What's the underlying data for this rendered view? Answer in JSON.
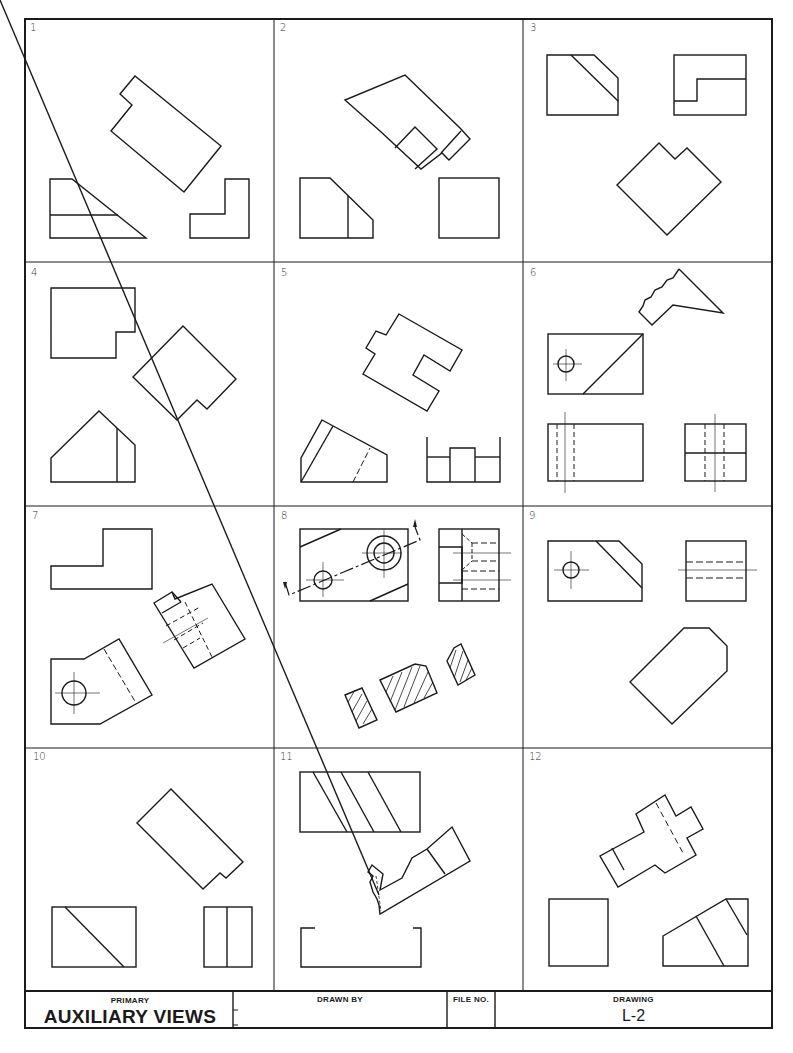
{
  "document": {
    "type": "drafting-worksheet",
    "border_color": "#1a1a1a",
    "line_color": "#1a1a1a"
  },
  "problems": [
    {
      "number": "1",
      "views": [
        "front-view",
        "side-view",
        "auxiliary-view-incomplete"
      ]
    },
    {
      "number": "2",
      "views": [
        "front-view",
        "side-view",
        "auxiliary-view-incomplete"
      ]
    },
    {
      "number": "3",
      "views": [
        "front-view",
        "side-view",
        "auxiliary-view-incomplete"
      ]
    },
    {
      "number": "4",
      "views": [
        "top-view",
        "front-view",
        "auxiliary-view-incomplete"
      ]
    },
    {
      "number": "5",
      "views": [
        "front-view",
        "side-view",
        "auxiliary-view-incomplete"
      ]
    },
    {
      "number": "6",
      "views": [
        "top-view",
        "front-view",
        "side-view",
        "partial-auxiliary-view"
      ]
    },
    {
      "number": "7",
      "views": [
        "top-view",
        "front-view",
        "auxiliary-view"
      ]
    },
    {
      "number": "8",
      "views": [
        "front-view",
        "side-view",
        "sectional-auxiliary-view"
      ]
    },
    {
      "number": "9",
      "views": [
        "front-view",
        "side-view",
        "auxiliary-view-incomplete"
      ]
    },
    {
      "number": "10",
      "views": [
        "front-view",
        "side-view",
        "auxiliary-view-incomplete"
      ]
    },
    {
      "number": "11",
      "views": [
        "top-view",
        "front-view-incomplete",
        "partial-auxiliary-view"
      ]
    },
    {
      "number": "12",
      "views": [
        "front-view",
        "side-view",
        "auxiliary-view"
      ]
    }
  ],
  "title_block": {
    "subtitle": "PRIMARY",
    "title": "AUXILIARY VIEWS",
    "drawn_by_label": "DRAWN BY",
    "drawn_by_value": "",
    "file_no_label": "FILE NO.",
    "file_no_value": "",
    "drawing_label": "DRAWING",
    "drawing_value": "L-2"
  }
}
